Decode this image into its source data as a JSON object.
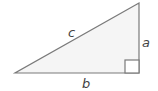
{
  "diagram": {
    "type": "right-triangle",
    "labels": {
      "hypotenuse": "c",
      "vertical_leg": "a",
      "horizontal_leg": "b"
    },
    "right_angle_marker": true,
    "colors": {
      "stroke": "#7a7a7a",
      "fill": "#f5f5f5",
      "label": "#444444"
    }
  }
}
